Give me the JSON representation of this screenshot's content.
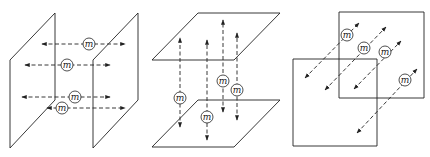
{
  "colors": {
    "line": "#222222",
    "background": "#ffffff"
  },
  "particle_label": "m",
  "panels": [
    {
      "name": "vertical-planes-horizontal-motion",
      "planes": [
        {
          "points": "55,13 10,60 10,148 55,100",
          "front": false
        },
        {
          "points": "138,13 93,60 93,148 138,100",
          "front": false
        }
      ],
      "arrows": [
        {
          "x1": 42,
          "y1": 44,
          "x2": 125,
          "y2": 44,
          "m": [
            89,
            44
          ]
        },
        {
          "x1": 25,
          "y1": 65,
          "x2": 110,
          "y2": 65,
          "m": [
            67,
            65
          ]
        },
        {
          "x1": 22,
          "y1": 97,
          "x2": 110,
          "y2": 97,
          "m": [
            75,
            97
          ]
        },
        {
          "x1": 47,
          "y1": 108,
          "x2": 125,
          "y2": 108,
          "m": [
            62,
            108
          ]
        }
      ]
    },
    {
      "name": "horizontal-planes-vertical-motion",
      "planes": [
        {
          "points": "198,13 280,13 234,60 152,60",
          "front": false
        },
        {
          "points": "198,100 280,100 234,147 152,147",
          "front": false
        }
      ],
      "arrows": [
        {
          "x1": 180,
          "y1": 127,
          "x2": 180,
          "y2": 38,
          "m": [
            180,
            98
          ]
        },
        {
          "x1": 207,
          "y1": 140,
          "x2": 207,
          "y2": 40,
          "m": [
            207,
            117
          ]
        },
        {
          "x1": 223,
          "y1": 112,
          "x2": 223,
          "y2": 20,
          "m": [
            223,
            81
          ]
        },
        {
          "x1": 237,
          "y1": 120,
          "x2": 237,
          "y2": 33,
          "m": [
            237,
            90
          ]
        }
      ]
    },
    {
      "name": "parallel-squares-diagonal-motion",
      "planes": [
        {
          "points": "339,12 424,12 424,98 339,98",
          "front": false
        },
        {
          "points": "293,59 377,59 377,146 293,146",
          "front": true
        }
      ],
      "arrows": [
        {
          "x1": 305,
          "y1": 78,
          "x2": 359,
          "y2": 23,
          "m": [
            347,
            35
          ]
        },
        {
          "x1": 325,
          "y1": 90,
          "x2": 386,
          "y2": 27,
          "m": [
            364,
            48
          ]
        },
        {
          "x1": 354,
          "y1": 89,
          "x2": 401,
          "y2": 41,
          "m": [
            385,
            52
          ]
        },
        {
          "x1": 357,
          "y1": 133,
          "x2": 417,
          "y2": 69,
          "m": [
            405,
            80
          ]
        }
      ]
    }
  ]
}
